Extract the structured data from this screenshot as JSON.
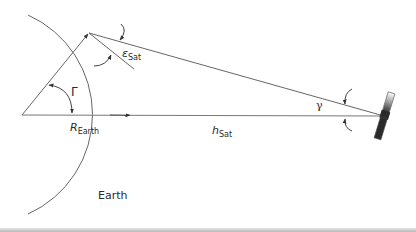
{
  "diagram": {
    "type": "satellite-earth geometry",
    "labels": {
      "elevation_angle": {
        "symbol": "ε",
        "subscript": "Sat"
      },
      "central_angle": {
        "symbol": "Γ"
      },
      "nadir_angle": {
        "symbol": "γ"
      },
      "earth_radius": {
        "symbol": "R",
        "subscript": "Earth"
      },
      "satellite_altitude": {
        "symbol": "h",
        "subscript": "Sat"
      },
      "earth": {
        "text": "Earth"
      }
    },
    "colors": {
      "line": "#555555",
      "text": "#2a2a2a",
      "satellite_dark": "#222222",
      "background": "#ffffff"
    }
  }
}
